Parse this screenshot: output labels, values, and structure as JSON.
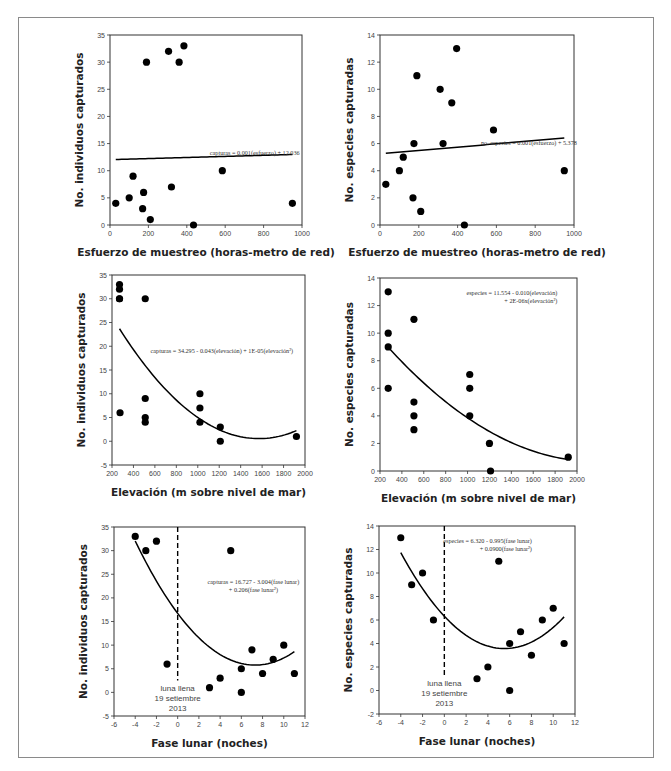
{
  "page": {
    "caption_fragment": "",
    "colors": {
      "points": "#000000",
      "axes": "#333333",
      "frame": "#8a8a8a",
      "text": "#222222"
    }
  },
  "chart_data": [
    {
      "id": "p1",
      "type": "scatter",
      "title": "",
      "xlabel": "Esfuerzo de muestreo (horas-metro de red)",
      "ylabel": "No. individuos capturados",
      "xlim": [
        0,
        1000
      ],
      "ylim": [
        0,
        35
      ],
      "xticks": [
        0,
        200,
        400,
        600,
        800,
        1000
      ],
      "yticks": [
        0,
        5,
        10,
        15,
        20,
        25,
        30,
        35
      ],
      "grid": false,
      "points": [
        [
          30,
          4
        ],
        [
          100,
          5
        ],
        [
          120,
          9
        ],
        [
          170,
          3
        ],
        [
          175,
          6
        ],
        [
          190,
          30
        ],
        [
          210,
          1
        ],
        [
          305,
          32
        ],
        [
          320,
          7
        ],
        [
          360,
          30
        ],
        [
          385,
          33
        ],
        [
          435,
          0
        ],
        [
          585,
          10
        ],
        [
          950,
          4
        ]
      ],
      "fit": {
        "kind": "linear",
        "a": 12.036,
        "b": 0.001,
        "x_range": [
          30,
          950
        ]
      },
      "equation": [
        "capturas = 0.001(esfuerzo) + 12.036"
      ],
      "equation_pos": [
        0.52,
        0.63
      ]
    },
    {
      "id": "p2",
      "type": "scatter",
      "title": "",
      "xlabel": "Esfuerzo de muestreo (horas-metro de red)",
      "ylabel": "No. especies capturadas",
      "xlim": [
        0,
        1000
      ],
      "ylim": [
        0,
        14
      ],
      "xticks": [
        0,
        200,
        400,
        600,
        800,
        1000
      ],
      "yticks": [
        0,
        2,
        4,
        6,
        8,
        10,
        12,
        14
      ],
      "grid": false,
      "points": [
        [
          30,
          3
        ],
        [
          100,
          4
        ],
        [
          120,
          5
        ],
        [
          170,
          2
        ],
        [
          175,
          6
        ],
        [
          190,
          11
        ],
        [
          210,
          1
        ],
        [
          310,
          10
        ],
        [
          325,
          6
        ],
        [
          370,
          9
        ],
        [
          395,
          13
        ],
        [
          435,
          0
        ],
        [
          585,
          7
        ],
        [
          950,
          4
        ]
      ],
      "fit": {
        "kind": "linear",
        "a": 5.25,
        "b": 0.00122,
        "x_range": [
          30,
          950
        ]
      },
      "equation": [
        "no. especies = 0.001(esfuerzo) + 5.378"
      ],
      "equation_pos": [
        0.52,
        0.58
      ]
    },
    {
      "id": "p3",
      "type": "scatter",
      "title": "",
      "xlabel": "Elevación (m sobre nivel de mar)",
      "ylabel": "No. individuos capturados",
      "xlim": [
        200,
        2000
      ],
      "ylim": [
        -5,
        35
      ],
      "xticks": [
        200,
        400,
        600,
        800,
        1000,
        1200,
        1400,
        1600,
        1800,
        2000
      ],
      "yticks": [
        -5,
        0,
        5,
        10,
        15,
        20,
        25,
        30,
        35
      ],
      "grid": false,
      "points": [
        [
          270,
          33
        ],
        [
          270,
          32
        ],
        [
          270,
          30
        ],
        [
          270,
          30
        ],
        [
          275,
          6
        ],
        [
          510,
          30
        ],
        [
          510,
          9
        ],
        [
          510,
          5
        ],
        [
          510,
          4
        ],
        [
          1020,
          10
        ],
        [
          1020,
          7
        ],
        [
          1020,
          4
        ],
        [
          1210,
          3
        ],
        [
          1210,
          0
        ],
        [
          1920,
          1
        ]
      ],
      "fit": {
        "kind": "quadratic",
        "a": 34.295,
        "b": -0.043,
        "c": 1.37e-05,
        "x_range": [
          270,
          1920
        ]
      },
      "equation": [
        "capturas = 34.295 - 0.043(elevación) + 1E-05(elevación²)"
      ],
      "equation_pos": [
        0.2,
        0.41
      ]
    },
    {
      "id": "p4",
      "type": "scatter",
      "title": "",
      "xlabel": "Elevación (m sobre nivel de mar)",
      "ylabel": "No. especies capturadas",
      "xlim": [
        200,
        2000
      ],
      "ylim": [
        0,
        14
      ],
      "xticks": [
        200,
        400,
        600,
        800,
        1000,
        1200,
        1400,
        1600,
        1800,
        2000
      ],
      "yticks": [
        0,
        2,
        4,
        6,
        8,
        10,
        12,
        14
      ],
      "grid": false,
      "points": [
        [
          275,
          13
        ],
        [
          275,
          10
        ],
        [
          275,
          9
        ],
        [
          275,
          6
        ],
        [
          510,
          11
        ],
        [
          510,
          5
        ],
        [
          510,
          4
        ],
        [
          510,
          3
        ],
        [
          1020,
          7
        ],
        [
          1020,
          6
        ],
        [
          1020,
          4
        ],
        [
          1200,
          2
        ],
        [
          1210,
          0
        ],
        [
          1920,
          1
        ]
      ],
      "fit": {
        "kind": "quadratic",
        "a": 11.554,
        "b": -0.01,
        "c": 2.3e-06,
        "x_range": [
          275,
          1920
        ]
      },
      "equation": [
        "especies = 11.554 - 0.010(elevación)",
        "+ 2E-06x(elevación²)"
      ],
      "equation_pos": [
        0.9,
        0.09
      ]
    },
    {
      "id": "p5",
      "type": "scatter",
      "title": "",
      "xlabel": "Fase lunar (noches)",
      "ylabel": "No. individuos capturados",
      "xlim": [
        -6,
        12
      ],
      "ylim": [
        -5,
        35
      ],
      "xticks": [
        -6,
        -4,
        -2,
        0,
        2,
        4,
        6,
        8,
        10,
        12
      ],
      "yticks": [
        -5,
        0,
        5,
        10,
        15,
        20,
        25,
        30,
        35
      ],
      "grid": false,
      "points": [
        [
          -4,
          33
        ],
        [
          -3,
          30
        ],
        [
          -2,
          32
        ],
        [
          -1,
          6
        ],
        [
          3,
          1
        ],
        [
          4,
          3
        ],
        [
          5,
          30
        ],
        [
          6,
          5
        ],
        [
          6,
          0
        ],
        [
          7,
          9
        ],
        [
          8,
          4
        ],
        [
          9,
          7
        ],
        [
          10,
          10
        ],
        [
          11,
          4
        ]
      ],
      "fit": {
        "kind": "quadratic",
        "a": 16.727,
        "b": -3.004,
        "c": 0.206,
        "x_range": [
          -4,
          11
        ]
      },
      "vline": {
        "x": 0,
        "y_from": 2.5,
        "y_to": 35,
        "style": "dashed"
      },
      "annotation": [
        "luna llena",
        "19 setiembre",
        "2013"
      ],
      "annotation_x": 0,
      "equation": [
        "capturas = 16.727 - 3.004(fase lunar)",
        "+ 0.206(fase lunar²)"
      ],
      "equation_pos": [
        0.73,
        0.3
      ]
    },
    {
      "id": "p6",
      "type": "scatter",
      "title": "",
      "xlabel": "Fase lunar (noches)",
      "ylabel": "No. especies capturadas",
      "xlim": [
        -6,
        12
      ],
      "ylim": [
        -2,
        14
      ],
      "xticks": [
        -6,
        -4,
        -2,
        0,
        2,
        4,
        6,
        8,
        10,
        12
      ],
      "yticks": [
        -2,
        0,
        2,
        4,
        6,
        8,
        10,
        12,
        14
      ],
      "grid": false,
      "points": [
        [
          -4,
          13
        ],
        [
          -3,
          9
        ],
        [
          -2,
          10
        ],
        [
          -1,
          6
        ],
        [
          3,
          1
        ],
        [
          4,
          2
        ],
        [
          5,
          11
        ],
        [
          6,
          4
        ],
        [
          6,
          0
        ],
        [
          7,
          5
        ],
        [
          8,
          3
        ],
        [
          9,
          6
        ],
        [
          10,
          7
        ],
        [
          11,
          4
        ]
      ],
      "fit": {
        "kind": "quadratic",
        "a": 6.32,
        "b": -0.995,
        "c": 0.09,
        "x_range": [
          -4,
          11
        ]
      },
      "vline": {
        "x": 0,
        "y_from": 1.2,
        "y_to": 14,
        "style": "dashed"
      },
      "annotation": [
        "luna llena",
        "19 setiembre",
        "2013"
      ],
      "annotation_x": 0,
      "equation": [
        "especies = 6.320 - 0.995(fase lunar)",
        "+ 0.0900(fase lunar²)"
      ],
      "equation_pos": [
        0.78,
        0.09
      ]
    }
  ],
  "layout": {
    "plots": [
      {
        "id": "p1",
        "box": [
          110,
          35,
          302,
          225
        ]
      },
      {
        "id": "p2",
        "box": [
          380,
          35,
          574,
          225
        ]
      },
      {
        "id": "p3",
        "box": [
          112,
          275,
          305,
          465
        ]
      },
      {
        "id": "p4",
        "box": [
          380,
          278,
          577,
          471
        ]
      },
      {
        "id": "p5",
        "box": [
          114,
          527,
          305,
          716
        ]
      },
      {
        "id": "p6",
        "box": [
          379,
          526,
          575,
          714
        ]
      }
    ]
  }
}
